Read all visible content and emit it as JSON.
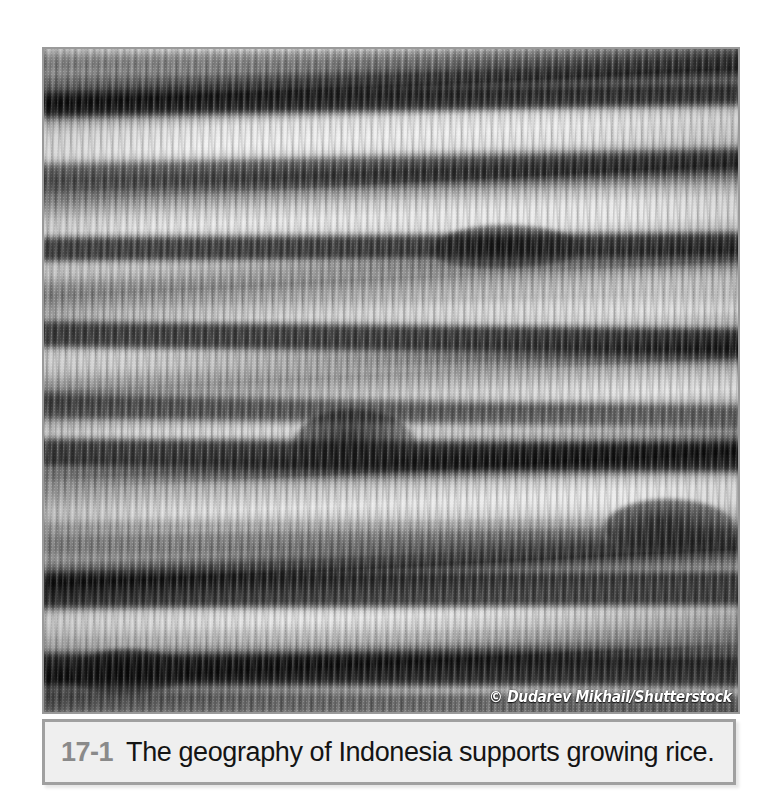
{
  "figure": {
    "number": "17-1",
    "caption": "The geography of Indonesia supports growing rice.",
    "credit": "© Dudarev Mikhail/Shutterstock",
    "photo_alt": "Aerial view of terraced rice paddies with rows of rice seedlings",
    "colors": {
      "caption_background": "#efefef",
      "caption_border": "#a0a0a0",
      "figure_number": "#8a8a8a",
      "caption_text": "#141414",
      "photo_border": "#9a9a9a",
      "page_background": "#ffffff",
      "credit_text": "#ffffff"
    }
  }
}
